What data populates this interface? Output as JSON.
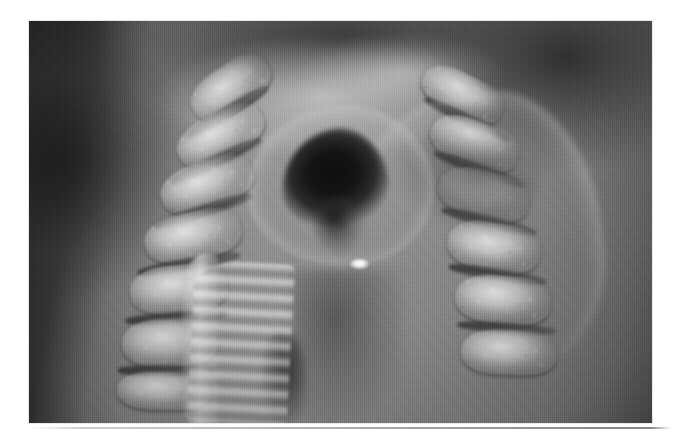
{
  "page": {
    "background_color": "#ffffff",
    "width": 684,
    "height": 436,
    "media_type": "printed photographic halftone on white page"
  },
  "figure": {
    "name": "anatomical-specimen-photograph",
    "kind": "grayscale photograph",
    "caption": "",
    "label": "",
    "frame": {
      "x": 29,
      "y": 21,
      "width": 623,
      "height": 402
    },
    "palette": {
      "darkest": "#0d0d0d",
      "shadow": "#2e2e2e",
      "midtone": "#7a7a7a",
      "base": "#8a8a8a",
      "highlight": "#e8e8e8",
      "specular": "#ffffff",
      "page": "#ffffff"
    },
    "regions": [
      {
        "name": "left-dark-margin",
        "description": "Deep shadow band running down the left edge of the print"
      },
      {
        "name": "left-vertebral-column",
        "description": "Column of pale, speckled cancellous vertebral bodies separated by dark intervertebral discs, running top-right to bottom-left"
      },
      {
        "name": "laryngeal-vault",
        "description": "Dark arched dome across the upper middle of the field"
      },
      {
        "name": "bright-arch",
        "description": "Pale highlighted arch of soft tissue sweeping over the airway inlet"
      },
      {
        "name": "airway-lumen",
        "description": "Near-black triangular cavity at the centre — the laryngeal inlet / tracheal lumen"
      },
      {
        "name": "specular-highlight",
        "description": "Small bright white reflection on moist mucosa just below the lumen"
      },
      {
        "name": "tracheal-rings",
        "description": "Scalloped, ladder-like band of cartilage rings descending at lower centre-left"
      },
      {
        "name": "posterior-wall",
        "description": "Broad mid-grey posterior wall / oesophageal region occupying the lower centre"
      },
      {
        "name": "right-vertebral-column",
        "description": "Second column of pale speckled bone with curving dark soft-tissue folds, upper-right to lower-right"
      }
    ],
    "artifacts": [
      {
        "name": "scan-shadow-line",
        "description": "Faint grey scanner shadow line along the lower page margin"
      },
      {
        "name": "halftone-grain",
        "description": "Fine vertical halftone screen texture across the whole print"
      }
    ]
  }
}
